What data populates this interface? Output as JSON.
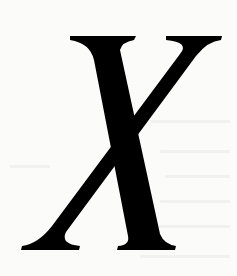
{
  "page": {
    "glyph": "X",
    "glyph_style": "serif italic",
    "glyph_color": "#000000",
    "background_color": "#fbfbfa"
  }
}
